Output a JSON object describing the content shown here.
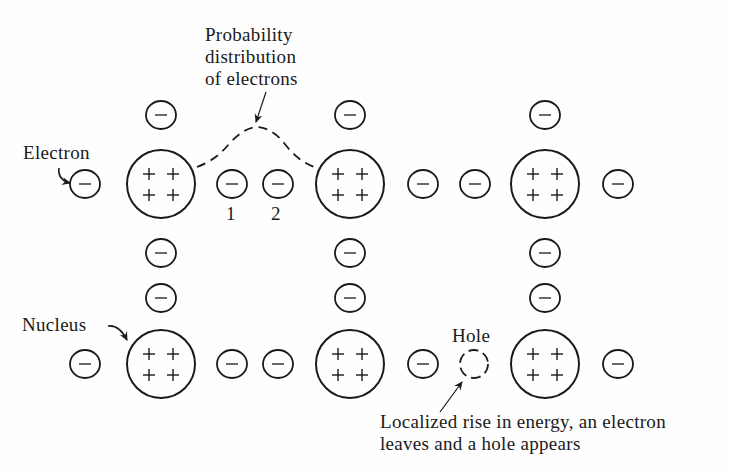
{
  "diagram": {
    "type": "semiconductor-lattice",
    "stroke_color": "#1a1a1a",
    "background": "#fefefe",
    "labels": {
      "probability": [
        "Probability",
        "distribution",
        "of electrons"
      ],
      "electron": "Electron",
      "nucleus": "Nucleus",
      "hole": "Hole",
      "electron_1": "1",
      "electron_2": "2",
      "energy_note": [
        "Localized rise in energy, an electron",
        "leaves and a hole appears"
      ]
    },
    "nucleus_symbol": "+ + + +",
    "electron_symbol": "−",
    "nuclei": [
      {
        "id": "n1",
        "cx": 161,
        "cy": 184,
        "r": 34
      },
      {
        "id": "n2",
        "cx": 350,
        "cy": 184,
        "r": 34
      },
      {
        "id": "n3",
        "cx": 545,
        "cy": 184,
        "r": 34
      },
      {
        "id": "n4",
        "cx": 161,
        "cy": 364,
        "r": 34
      },
      {
        "id": "n5",
        "cx": 350,
        "cy": 364,
        "r": 34
      },
      {
        "id": "n6",
        "cx": 545,
        "cy": 364,
        "r": 34
      }
    ],
    "electrons": [
      {
        "cx": 161,
        "cy": 115
      },
      {
        "cx": 350,
        "cy": 115
      },
      {
        "cx": 545,
        "cy": 115
      },
      {
        "cx": 85,
        "cy": 184
      },
      {
        "cx": 232,
        "cy": 184
      },
      {
        "cx": 278,
        "cy": 184
      },
      {
        "cx": 423,
        "cy": 184
      },
      {
        "cx": 475,
        "cy": 184
      },
      {
        "cx": 618,
        "cy": 184
      },
      {
        "cx": 161,
        "cy": 253
      },
      {
        "cx": 350,
        "cy": 253
      },
      {
        "cx": 545,
        "cy": 253
      },
      {
        "cx": 161,
        "cy": 298
      },
      {
        "cx": 350,
        "cy": 298
      },
      {
        "cx": 545,
        "cy": 298
      },
      {
        "cx": 85,
        "cy": 364
      },
      {
        "cx": 232,
        "cy": 364
      },
      {
        "cx": 278,
        "cy": 364
      },
      {
        "cx": 423,
        "cy": 364
      },
      {
        "cx": 618,
        "cy": 364
      }
    ],
    "hole": {
      "cx": 474,
      "cy": 364,
      "r": 14
    },
    "electron_radius": 15
  }
}
